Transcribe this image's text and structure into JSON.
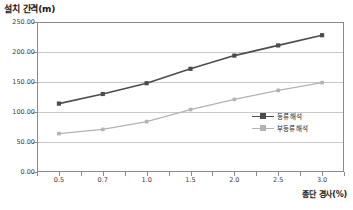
{
  "chart_data": {
    "type": "line",
    "title": "설치 간격(m)",
    "xlabel": "종단 경사(%)",
    "ylabel": "설치 간격(m)",
    "categories": [
      "0.5",
      "0.7",
      "1.0",
      "1.5",
      "2.0",
      "2.5",
      "3.0"
    ],
    "ylim": [
      0,
      250
    ],
    "yticks": [
      "0.00",
      "50.00",
      "100.00",
      "150.00",
      "200.00",
      "250.00"
    ],
    "ytick_values": [
      0,
      50,
      100,
      150,
      200,
      250
    ],
    "grid": true,
    "legend_position": "inside-bottom-right",
    "series": [
      {
        "name": "등류 해석",
        "color": "#4d4d4d",
        "marker": "square",
        "values": [
          114,
          130,
          148,
          172,
          194,
          211,
          228
        ]
      },
      {
        "name": "부등류 해석",
        "color": "#b3b3b3",
        "marker": "square",
        "values": [
          64,
          71,
          84,
          104,
          121,
          136,
          149
        ]
      }
    ]
  },
  "colors": {
    "series_dark": "#4d4d4d",
    "series_light": "#b3b3b3",
    "gridline": "#c9c9c9",
    "frame": "#8a8a8a",
    "text": "#333333",
    "background": "#ffffff"
  }
}
